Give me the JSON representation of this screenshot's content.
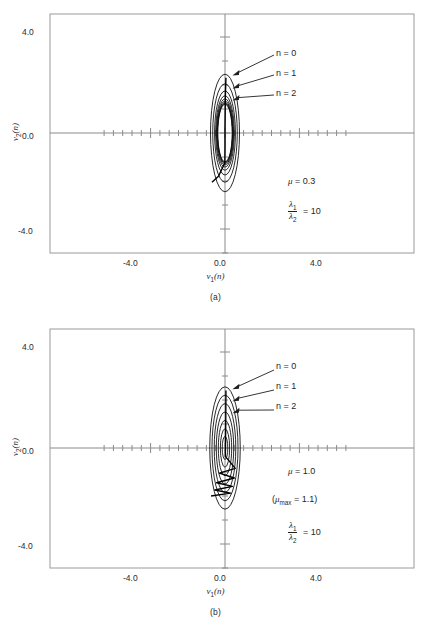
{
  "figure": {
    "axis_labels": {
      "x": "ν₁(n)",
      "y": "ν₂(n)",
      "x_sym": "ν",
      "x_sub": "1",
      "y_sym": "ν",
      "y_sub": "2",
      "arg": "(n)"
    },
    "tick_labels": {
      "x": [
        "-4.0",
        "0.0",
        "4.0"
      ],
      "y": [
        "4.0",
        "0.0",
        "-4.0"
      ]
    },
    "contour_labels": [
      "n = 0",
      "n = 1",
      "n = 2"
    ],
    "colors": {
      "axis": "#8a8a8a",
      "frame": "#9a9a9a",
      "contour": "#111111",
      "trajectory": "#000000",
      "text": "#1f1f1f",
      "background": "#ffffff"
    }
  },
  "panels": [
    {
      "id": "a",
      "caption": "(a)",
      "annotations": [
        {
          "kind": "mu",
          "label": "μ = 0.3",
          "mu": "μ",
          "eq": "= 0.3"
        },
        {
          "kind": "ratio",
          "num": "λ₁",
          "den": "λ₂",
          "eq": "= 10"
        }
      ],
      "chart_data": {
        "type": "line",
        "title": "(a)",
        "xlabel": "ν₁(n)",
        "ylabel": "ν₂(n)",
        "xlim": [
          -6.5,
          6.5
        ],
        "ylim": [
          -5.6,
          5.6
        ],
        "xticks_major": [
          -4.0,
          0.0,
          4.0
        ],
        "yticks_major": [
          4.0,
          0.0,
          -4.0
        ],
        "xtick_step": 0.5,
        "ytick_step": 1.0,
        "grid": false,
        "mu": 0.3,
        "eigenvalue_ratio": 10,
        "contours": {
          "description": "nested elliptical constant-error contours, semi-axis ratio 1:10 (narrow in v1, tall in v2)",
          "count": 9,
          "semi_axis_v1": [
            0.78,
            0.66,
            0.56,
            0.5,
            0.46,
            0.43,
            0.41,
            0.4,
            0.39
          ],
          "semi_axis_v2": [
            2.45,
            2.05,
            1.75,
            1.55,
            1.42,
            1.33,
            1.27,
            1.23,
            1.2
          ]
        },
        "trajectory": {
          "description": "steepest-descent path, small mu: slow convergence creeping down the v2 axis",
          "points": [
            [
              0.05,
              2.3
            ],
            [
              0.02,
              1.55
            ],
            [
              0.01,
              0.85
            ],
            [
              0.0,
              0.15
            ],
            [
              0.0,
              -0.6
            ],
            [
              -0.01,
              -1.25
            ],
            [
              -0.35,
              -1.8
            ],
            [
              -0.7,
              -2.05
            ]
          ]
        },
        "label_anchors": [
          {
            "label": "n = 0",
            "x": 0.95,
            "y": 2.4
          },
          {
            "label": "n = 1",
            "x": 0.95,
            "y": 1.85
          },
          {
            "label": "n = 2",
            "x": 0.95,
            "y": 1.35
          }
        ]
      }
    },
    {
      "id": "b",
      "caption": "(b)",
      "annotations": [
        {
          "kind": "mu",
          "label": "μ = 1.0",
          "mu": "μ",
          "eq": "= 1.0"
        },
        {
          "kind": "mumax",
          "label": "(μ_max = 1.1)",
          "mu": "μ",
          "sub": "max",
          "eq": "= 1.1)"
        },
        {
          "kind": "ratio",
          "num": "λ₁",
          "den": "λ₂",
          "eq": "= 10"
        }
      ],
      "chart_data": {
        "type": "line",
        "title": "(b)",
        "xlabel": "ν₁(n)",
        "ylabel": "ν₂(n)",
        "xlim": [
          -6.5,
          6.5
        ],
        "ylim": [
          -5.6,
          5.6
        ],
        "xticks_major": [
          -4.0,
          0.0,
          4.0
        ],
        "yticks_major": [
          4.0,
          0.0,
          -4.0
        ],
        "xtick_step": 0.5,
        "ytick_step": 1.0,
        "grid": false,
        "mu": 1.0,
        "mu_max": 1.1,
        "eigenvalue_ratio": 10,
        "contours": {
          "description": "nested elliptical constant-error contours, widely spaced",
          "count": 7,
          "semi_axis_v1": [
            0.82,
            0.7,
            0.58,
            0.47,
            0.36,
            0.25,
            0.15
          ],
          "semi_axis_v2": [
            2.55,
            2.2,
            1.85,
            1.5,
            1.15,
            0.8,
            0.48
          ]
        },
        "trajectory": {
          "description": "steepest-descent path, mu near mu_max: zigzag oscillation across the v2 axis while converging",
          "points": [
            [
              0.05,
              2.4
            ],
            [
              0.04,
              1.1
            ],
            [
              0.03,
              0.3
            ],
            [
              0.02,
              -0.35
            ],
            [
              0.55,
              -0.85
            ],
            [
              -0.3,
              -1.05
            ],
            [
              0.5,
              -1.25
            ],
            [
              -0.45,
              -1.45
            ],
            [
              0.4,
              -1.6
            ],
            [
              -0.55,
              -1.75
            ],
            [
              0.3,
              -1.88
            ],
            [
              -0.75,
              -2.0
            ]
          ]
        },
        "label_anchors": [
          {
            "label": "n = 0",
            "x": 0.95,
            "y": 2.45
          },
          {
            "label": "n = 1",
            "x": 0.95,
            "y": 1.95
          },
          {
            "label": "n = 2",
            "x": 0.95,
            "y": 1.45
          }
        ]
      }
    }
  ]
}
